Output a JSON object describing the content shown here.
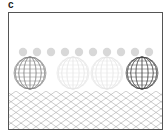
{
  "panel": {
    "label": "c"
  },
  "scene": {
    "description": "Wireframe spheres above a perspective grid floor",
    "horizon_y": 67,
    "small_balls": {
      "count": 10,
      "y": 39,
      "radius": 4.2,
      "color": "#d8d8d8"
    },
    "large_spheres": [
      {
        "cx": 21,
        "cy": 60,
        "r": 16,
        "stroke": "#777777",
        "opacity": 0.9
      },
      {
        "cx": 64,
        "cy": 60,
        "r": 16,
        "stroke": "#cfcfcf",
        "opacity": 0.5
      },
      {
        "cx": 98,
        "cy": 60,
        "r": 16,
        "stroke": "#cfcfcf",
        "opacity": 0.5
      },
      {
        "cx": 133,
        "cy": 60,
        "r": 16,
        "stroke": "#444444",
        "opacity": 1.0
      }
    ],
    "floor_color": "#9a9a9a"
  }
}
